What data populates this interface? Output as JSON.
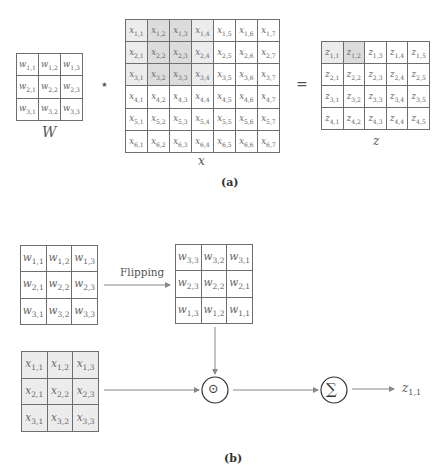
{
  "panel_a": {
    "caption": "(a)",
    "kernel": {
      "label": "W",
      "rows": [
        [
          "w",
          "1,1",
          "w",
          "1,2",
          "w",
          "1,3"
        ]
      ],
      "cells": [
        [
          {
            "v": "w",
            "s": "1,1"
          },
          {
            "v": "w",
            "s": "1,2"
          },
          {
            "v": "w",
            "s": "1,3"
          }
        ],
        [
          {
            "v": "w",
            "s": "2,1"
          },
          {
            "v": "w",
            "s": "2,2"
          },
          {
            "v": "w",
            "s": "2,3"
          }
        ],
        [
          {
            "v": "w",
            "s": "3,1"
          },
          {
            "v": "w",
            "s": "3,2"
          },
          {
            "v": "w",
            "s": "3,3"
          }
        ]
      ]
    },
    "operator": "⋆",
    "equals": "=",
    "input": {
      "label": "x",
      "rows": 6,
      "cols": 7,
      "var": "x",
      "shade_light": [
        [
          1,
          1
        ],
        [
          1,
          4
        ],
        [
          2,
          1
        ],
        [
          2,
          4
        ],
        [
          3,
          1
        ],
        [
          3,
          4
        ]
      ],
      "shade_dark": [
        [
          1,
          2
        ],
        [
          1,
          3
        ],
        [
          2,
          2
        ],
        [
          2,
          3
        ],
        [
          3,
          2
        ],
        [
          3,
          3
        ]
      ]
    },
    "output": {
      "label": "z",
      "rows": 4,
      "cols": 5,
      "var": "z",
      "shade_light": [
        [
          1,
          1
        ]
      ],
      "shade_dark": [
        [
          1,
          2
        ]
      ]
    }
  },
  "panel_b": {
    "caption": "(b)",
    "kernel": {
      "cells": [
        [
          {
            "v": "w",
            "s": "1,1"
          },
          {
            "v": "w",
            "s": "1,2"
          },
          {
            "v": "w",
            "s": "1,3"
          }
        ],
        [
          {
            "v": "w",
            "s": "2,1"
          },
          {
            "v": "w",
            "s": "2,2"
          },
          {
            "v": "w",
            "s": "2,3"
          }
        ],
        [
          {
            "v": "w",
            "s": "3,1"
          },
          {
            "v": "w",
            "s": "3,2"
          },
          {
            "v": "w",
            "s": "3,3"
          }
        ]
      ]
    },
    "flip_label": "Flipping",
    "flipped_kernel": {
      "cells": [
        [
          {
            "v": "w",
            "s": "3,3"
          },
          {
            "v": "w",
            "s": "3,2"
          },
          {
            "v": "w",
            "s": "3,1"
          }
        ],
        [
          {
            "v": "w",
            "s": "2,3"
          },
          {
            "v": "w",
            "s": "2,2"
          },
          {
            "v": "w",
            "s": "2,1"
          }
        ],
        [
          {
            "v": "w",
            "s": "1,3"
          },
          {
            "v": "w",
            "s": "1,2"
          },
          {
            "v": "w",
            "s": "1,1"
          }
        ]
      ]
    },
    "patch": {
      "cells": [
        [
          {
            "v": "x",
            "s": "1,1"
          },
          {
            "v": "x",
            "s": "1,2"
          },
          {
            "v": "x",
            "s": "1,3"
          }
        ],
        [
          {
            "v": "x",
            "s": "2,1"
          },
          {
            "v": "x",
            "s": "2,2"
          },
          {
            "v": "x",
            "s": "2,3"
          }
        ],
        [
          {
            "v": "x",
            "s": "3,1"
          },
          {
            "v": "x",
            "s": "3,2"
          },
          {
            "v": "x",
            "s": "3,3"
          }
        ]
      ]
    },
    "hadamard_symbol": "⊙",
    "sum_symbol": "∑",
    "result": {
      "v": "z",
      "s": "1,1"
    }
  },
  "colors": {
    "shade_light": "#ececec",
    "shade_dark": "#dcdcdc",
    "line": "#6e6e6e",
    "arrow": "#888888"
  }
}
